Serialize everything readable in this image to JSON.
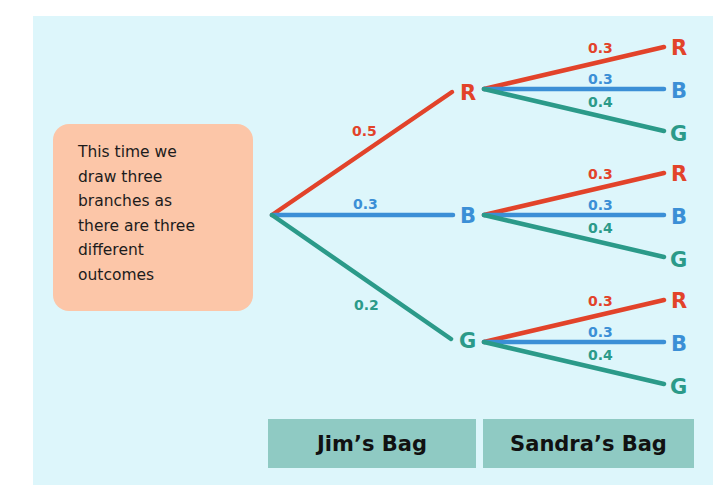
{
  "callout": {
    "lines": [
      "This time we",
      "draw three",
      "branches as",
      "there are three",
      "different",
      "outcomes"
    ]
  },
  "colors": {
    "red": "#e2432a",
    "blue": "#3b8fd6",
    "green": "#2b9a89",
    "panel": "#ddf6fb",
    "callout": "#fcc6a8",
    "bag": "#8fcac3"
  },
  "tree": {
    "first": [
      {
        "outcome": "R",
        "prob": "0.5",
        "color": "red"
      },
      {
        "outcome": "B",
        "prob": "0.3",
        "color": "blue"
      },
      {
        "outcome": "G",
        "prob": "0.2",
        "color": "green"
      }
    ],
    "second": [
      {
        "outcome": "R",
        "prob": "0.3",
        "color": "red"
      },
      {
        "outcome": "B",
        "prob": "0.3",
        "color": "blue"
      },
      {
        "outcome": "G",
        "prob": "0.4",
        "color": "green"
      }
    ]
  },
  "labels": {
    "first_node_R": "R",
    "first_node_B": "B",
    "first_node_G": "G",
    "p1_R": "0.5",
    "p1_B": "0.3",
    "p1_G": "0.2",
    "p2_R": "0.3",
    "p2_B": "0.3",
    "p2_G": "0.4",
    "leaf_R": "R",
    "leaf_B": "B",
    "leaf_G": "G"
  },
  "footer": {
    "jim": "Jim’s Bag",
    "sandra": "Sandra’s Bag"
  }
}
